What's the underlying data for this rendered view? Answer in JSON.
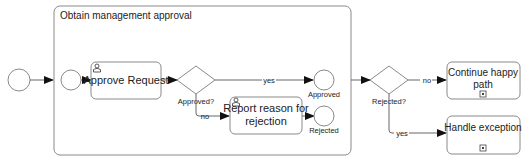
{
  "diagram": {
    "type": "BPMN process",
    "subprocess": {
      "title": "Obtain management approval"
    },
    "events": {
      "start_outer": {
        "label": ""
      },
      "start_inner": {
        "label": ""
      },
      "end_approved": {
        "label": "Approved"
      },
      "end_rejected": {
        "label": "Rejected"
      }
    },
    "tasks": {
      "approve_request": {
        "label": "Approve Request",
        "type": "user-task"
      },
      "report_reason": {
        "line1": "Report reason for",
        "line2": "rejection",
        "type": "user-task"
      },
      "continue_happy": {
        "line1": "Continue happy",
        "line2": "path",
        "type": "collapsed-subprocess"
      },
      "handle_exception": {
        "label": "Handle exception",
        "type": "collapsed-subprocess"
      }
    },
    "gateways": {
      "approved": {
        "label": "Approved?"
      },
      "rejected": {
        "label": "Rejected?"
      }
    },
    "flows": {
      "approved_yes": "yes",
      "approved_no": "no",
      "rejected_no": "no",
      "rejected_yes": "yes"
    },
    "colors": {
      "stroke": "#8a8a8a",
      "fill": "#ffffff",
      "text": "#222222"
    }
  }
}
